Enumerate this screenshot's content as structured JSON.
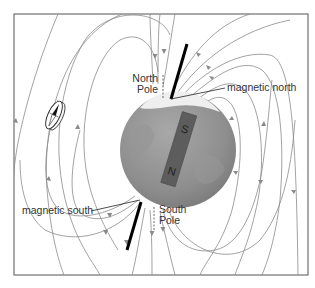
{
  "diagram": {
    "labels": {
      "north_pole_line1": "North",
      "north_pole_line2": "Pole",
      "south_pole_line1": "South",
      "south_pole_line2": "Pole",
      "magnetic_north": "magnetic north",
      "magnetic_south": "magnetic south"
    },
    "magnet": {
      "top_letter": "S",
      "bottom_letter": "N"
    },
    "elements": {
      "compass": "compass-icon",
      "globe": "earth-globe",
      "bar_magnet": "bar-magnet",
      "rotation_axis": "rotation-axis",
      "field_lines": "magnetic-field-lines"
    },
    "colors": {
      "field_line": "#8a8a8a",
      "globe": "#8c8c8c",
      "globe_highlight": "#b5b5b5",
      "ice_cap": "#eeeeee",
      "magnet": "#5b5b5b",
      "axis": "#000000",
      "frame": "#555555",
      "text": "#333333"
    }
  }
}
